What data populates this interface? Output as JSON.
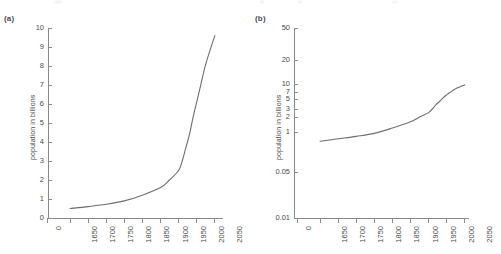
{
  "figure": {
    "background_color": "#ffffff",
    "curve_color": "#6e6e6e",
    "axis_color": "#8a8a8a",
    "text_color": "#4a4a4a"
  },
  "panels": [
    {
      "label": "(a)",
      "ylabel": "population in billions",
      "xlabel": "",
      "yticks": [
        "0",
        "1",
        "2",
        "3",
        "4",
        "5",
        "6",
        "7",
        "8",
        "9",
        "10"
      ],
      "xticks": [
        "0",
        "1650",
        "1700",
        "1750",
        "1800",
        "1850",
        "1900",
        "1950",
        "2000",
        "2050"
      ]
    },
    {
      "label": "(b)",
      "ylabel": "population in billions",
      "xlabel": "",
      "yticks": [
        "0.01",
        "0.05",
        "1",
        "2",
        "3",
        "5",
        "7",
        "10",
        "20",
        "50"
      ],
      "xticks": [
        "0",
        "1650",
        "1700",
        "1750",
        "1800",
        "1850",
        "1900",
        "1950",
        "2000",
        "2050"
      ]
    }
  ],
  "chart_data": [
    {
      "type": "line",
      "title": "(a)",
      "xlabel": "",
      "ylabel": "population in billions",
      "yscale": "linear",
      "xlim": [
        1650,
        2050
      ],
      "ylim": [
        0,
        10
      ],
      "grid": false,
      "legend": "none",
      "xtick_labels": [
        "0",
        "1650",
        "1700",
        "1750",
        "1800",
        "1850",
        "1900",
        "1950",
        "2000",
        "2050"
      ],
      "ytick_labels": [
        "0",
        "1",
        "2",
        "3",
        "4",
        "5",
        "6",
        "7",
        "8",
        "9",
        "10"
      ],
      "series": [
        {
          "name": "world population",
          "x": [
            1650,
            1700,
            1750,
            1800,
            1850,
            1900,
            1925,
            1950,
            1960,
            1970,
            1980,
            1990,
            2000,
            2010,
            2025,
            2050
          ],
          "values": [
            0.5,
            0.6,
            0.72,
            0.9,
            1.2,
            1.6,
            2.0,
            2.5,
            3.0,
            3.7,
            4.4,
            5.3,
            6.1,
            6.9,
            8.1,
            9.6
          ]
        }
      ]
    },
    {
      "type": "line",
      "title": "(b)",
      "xlabel": "",
      "ylabel": "population in billions",
      "yscale": "log",
      "xlim": [
        1650,
        2050
      ],
      "ylim": [
        0.01,
        50
      ],
      "grid": false,
      "legend": "none",
      "xtick_labels": [
        "0",
        "1650",
        "1700",
        "1750",
        "1800",
        "1850",
        "1900",
        "1950",
        "2000",
        "2050"
      ],
      "ytick_labels": [
        "0.01",
        "0.05",
        "1",
        "2",
        "3",
        "5",
        "7",
        "10",
        "20",
        "50"
      ],
      "series": [
        {
          "name": "world population",
          "x": [
            1650,
            1700,
            1750,
            1800,
            1850,
            1900,
            1925,
            1950,
            1960,
            1970,
            1980,
            1990,
            2000,
            2010,
            2025,
            2050
          ],
          "values": [
            0.5,
            0.6,
            0.72,
            0.9,
            1.2,
            1.6,
            2.0,
            2.5,
            3.0,
            3.7,
            4.4,
            5.3,
            6.1,
            6.9,
            8.1,
            9.6
          ]
        }
      ]
    }
  ]
}
